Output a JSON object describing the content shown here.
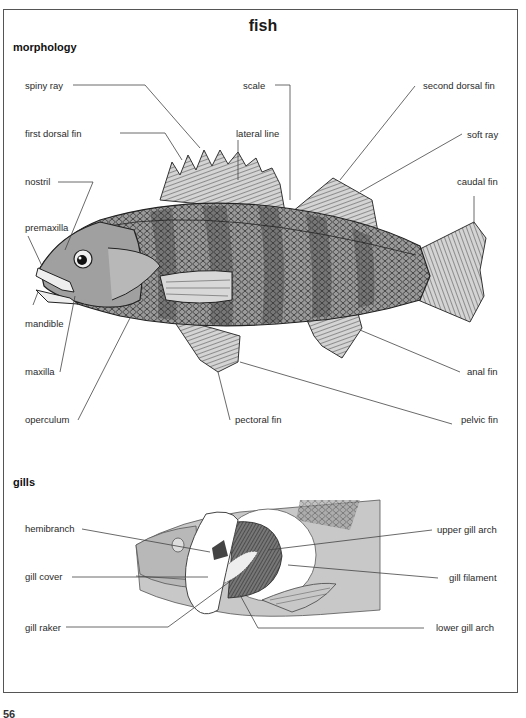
{
  "page": {
    "title": "fish",
    "page_number_partial": "56"
  },
  "morphology": {
    "heading": "morphology",
    "labels": {
      "spiny_ray": "spiny ray",
      "scale": "scale",
      "second_dorsal_fin": "second dorsal fin",
      "first_dorsal_fin": "first dorsal fin",
      "lateral_line": "lateral line",
      "soft_ray": "soft ray",
      "nostril": "nostril",
      "caudal_fin": "caudal fin",
      "premaxilla": "premaxilla",
      "mandible": "mandible",
      "maxilla": "maxilla",
      "anal_fin": "anal fin",
      "operculum": "operculum",
      "pectoral_fin": "pectoral fin",
      "pelvic_fin": "pelvic fin"
    }
  },
  "gills": {
    "heading": "gills",
    "labels": {
      "hemibranch": "hemibranch",
      "upper_gill_arch": "upper gill arch",
      "gill_cover": "gill cover",
      "gill_filament": "gill filament",
      "gill_raker": "gill raker",
      "lower_gill_arch": "lower gill arch"
    }
  },
  "colors": {
    "frame": "#555555",
    "body_fill": "#8a8a8a",
    "fin_fill": "#c8c8c8",
    "head_fill": "#a8a8a8",
    "gill_bg": "#c9c9c9",
    "leader_line": "#444444"
  }
}
